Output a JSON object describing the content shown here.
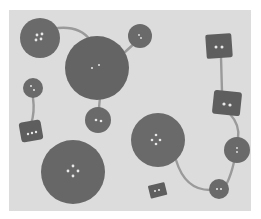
{
  "image": {
    "description": "Grayscale photograph of assorted buttons (round and square) linked by thin strings on a light gray background",
    "colors": {
      "background": "#dcdcdc",
      "button": "#6e6e6e",
      "button_dark": "#5f5f5f",
      "string": "#9a9a9a",
      "hole": "#e8e8e8"
    },
    "round_buttons": [
      {
        "cx": 40,
        "cy": 38,
        "r": 20,
        "holes": 4
      },
      {
        "cx": 97,
        "cy": 68,
        "r": 32,
        "holes": 2
      },
      {
        "cx": 140,
        "cy": 36,
        "r": 12,
        "holes": 2
      },
      {
        "cx": 33,
        "cy": 88,
        "r": 10,
        "holes": 2
      },
      {
        "cx": 98,
        "cy": 120,
        "r": 13,
        "holes": 2
      },
      {
        "cx": 73,
        "cy": 172,
        "r": 32,
        "holes": 4
      },
      {
        "cx": 158,
        "cy": 140,
        "r": 27,
        "holes": 4
      },
      {
        "cx": 237,
        "cy": 150,
        "r": 13,
        "holes": 2
      },
      {
        "cx": 219,
        "cy": 189,
        "r": 10,
        "holes": 2
      }
    ],
    "square_buttons": [
      {
        "x": 206,
        "y": 34,
        "w": 26,
        "h": 24,
        "rot": -4,
        "holes": 2
      },
      {
        "x": 213,
        "y": 91,
        "w": 28,
        "h": 24,
        "rot": 6,
        "holes": 2
      },
      {
        "x": 20,
        "y": 121,
        "w": 22,
        "h": 20,
        "rot": -10,
        "holes": 3
      },
      {
        "x": 149,
        "y": 184,
        "w": 17,
        "h": 13,
        "rot": -14,
        "holes": 2
      }
    ]
  }
}
